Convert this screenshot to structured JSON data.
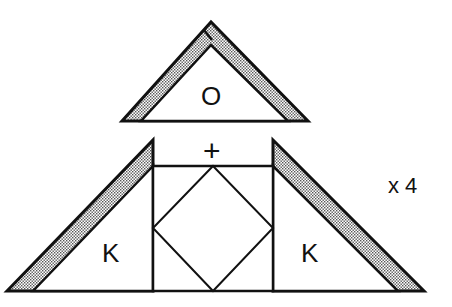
{
  "diagram": {
    "type": "quilt-piecing-diagram",
    "pieces": {
      "top_triangle": {
        "label": "O"
      },
      "left_triangle": {
        "label": "K"
      },
      "right_triangle": {
        "label": "K"
      },
      "center_block": {
        "description": "square-in-square block"
      }
    },
    "join_symbol": "+",
    "multiplier": "x 4",
    "colors": {
      "line": "#111111",
      "background": "#ffffff",
      "stipple": "#9a9a9a"
    }
  }
}
